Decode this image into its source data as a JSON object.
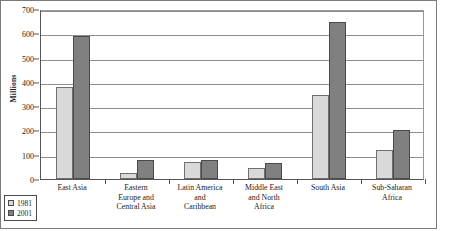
{
  "chart_data": {
    "type": "bar",
    "title": "",
    "xlabel": "",
    "ylabel": "Millions",
    "ylim": [
      0,
      700
    ],
    "ytick_step": 100,
    "yticks": [
      0,
      100,
      200,
      300,
      400,
      500,
      600,
      700
    ],
    "grid": true,
    "legend_position": "bottom-left",
    "categories": [
      "East Asia",
      "Eastern Europe and Central Asia",
      "Latin America and Caribbean",
      "Middle East and North Africa",
      "South Asia",
      "Sub-Saharan Africa"
    ],
    "category_lines": [
      [
        "East Asia"
      ],
      [
        "Eastern",
        "Europe and",
        "Central Asia"
      ],
      [
        "Latin America",
        "and",
        "Caribbean"
      ],
      [
        "Middle East",
        "and North",
        "Africa"
      ],
      [
        "South Asia"
      ],
      [
        "Sub-Saharan",
        "Africa"
      ]
    ],
    "series": [
      {
        "name": "1981",
        "color": "#d9d9d9",
        "values": [
          380,
          25,
          70,
          45,
          345,
          120
        ]
      },
      {
        "name": "2001",
        "color": "#808080",
        "values": [
          590,
          80,
          80,
          68,
          645,
          200
        ]
      }
    ]
  },
  "legend": {
    "items": [
      {
        "label": "1981",
        "swatch": "light-gray-swatch"
      },
      {
        "label": "2001",
        "swatch": "dark-gray-swatch"
      }
    ]
  }
}
